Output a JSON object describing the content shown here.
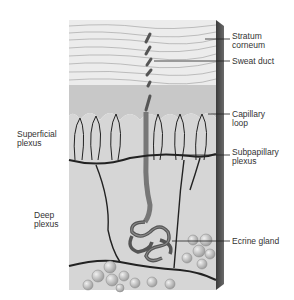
{
  "diagram": {
    "labels_right": [
      {
        "id": "stratum-corneum",
        "text": "Stratum\ncorneum"
      },
      {
        "id": "sweat-duct",
        "text": "Sweat duct"
      },
      {
        "id": "capillary-loop",
        "text": "Capillary\nloop"
      },
      {
        "id": "subpapillary-plexus",
        "text": "Subpapillary\nplexus"
      },
      {
        "id": "ecrine-gland",
        "text": "Ecrine gland"
      }
    ],
    "labels_left": [
      {
        "id": "superficial-plexus",
        "text": "Superficial\nplexus"
      },
      {
        "id": "deep-plexus",
        "text": "Deep\nplexus"
      }
    ]
  },
  "colors": {
    "background": "#ffffff",
    "epidermis": "#e6e6e6",
    "dermis": "#d4d4d4",
    "vessel": "#2a2a2a",
    "side_edge": "#4a4a4a",
    "label_text": "#333333"
  }
}
